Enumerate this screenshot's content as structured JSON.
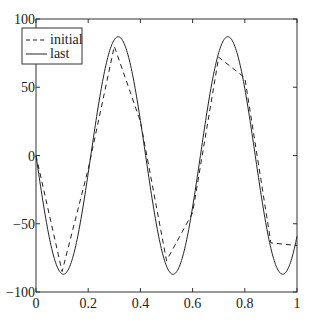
{
  "chart_data": {
    "type": "line",
    "title": "",
    "xlabel": "",
    "ylabel": "",
    "xlim": [
      0,
      1
    ],
    "ylim": [
      -100,
      100
    ],
    "grid": false,
    "legend_position": "upper-left",
    "xticks": [
      "0",
      "0.2",
      "0.4",
      "0.6",
      "0.8",
      "1"
    ],
    "yticks": [
      "100",
      "50",
      "0",
      "-50",
      "-100"
    ],
    "series": [
      {
        "name": "initial",
        "style": "dashed",
        "x": [
          0,
          0.1,
          0.2,
          0.3,
          0.4,
          0.5,
          0.6,
          0.7,
          0.8,
          0.9,
          1.0
        ],
        "y": [
          0,
          -85,
          -10,
          80,
          25,
          -77,
          -42,
          72,
          57,
          -64,
          -66
        ]
      },
      {
        "name": "last",
        "style": "solid",
        "function": "y = -87 * sin(2*pi*x/0.42)",
        "amplitude": 87,
        "period": 0.42
      }
    ]
  },
  "legend": {
    "items": [
      "initial",
      "last"
    ]
  },
  "colors": {
    "line": "#222222",
    "axis": "#333333"
  }
}
